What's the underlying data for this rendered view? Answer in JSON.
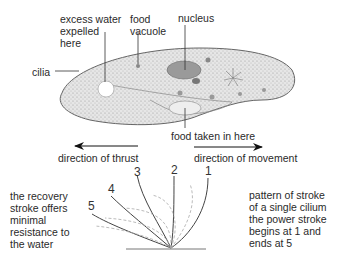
{
  "labels": {
    "excess_water": [
      "excess water",
      "expelled",
      "here"
    ],
    "food_vacuole": [
      "food",
      "vacuole"
    ],
    "nucleus": "nucleus",
    "cilia": "cilia",
    "food_taken_in": "food taken in here",
    "direction_of_thrust": "direction of thrust",
    "direction_of_movement": "direction of movement",
    "recovery_stroke": [
      "the recovery",
      "stroke offers",
      "minimal",
      "resistance to",
      "the water"
    ],
    "stroke_pattern": [
      "pattern of stroke",
      "of a single cilium",
      "the power stroke",
      "begins at 1 and",
      "ends at 5"
    ]
  },
  "stroke_positions": [
    "1",
    "2",
    "3",
    "4",
    "5"
  ],
  "colors": {
    "body_fill": "#d8d8d8",
    "outline": "#555555",
    "nucleus": "#9a9a9a",
    "dashed": "#aaaaaa"
  }
}
